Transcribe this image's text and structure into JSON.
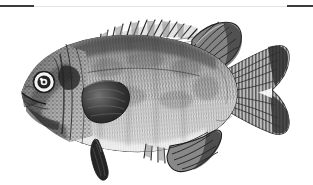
{
  "document": {
    "background_color": "#ffffff",
    "width_px": 313,
    "height_px": 185
  },
  "rule": {
    "name": "horizontal-rule",
    "hairline_color": "#e3e3e3",
    "segment_color": "#3a3a3a",
    "left_segment_label": "left rule segment",
    "right_segment_label": "right rule segment"
  },
  "illustration": {
    "type": "engraving",
    "subject": "sunfish",
    "orientation": "left-facing lateral view",
    "ink_color": "#2b2b2b",
    "midtone_color": "#8d8d8d",
    "highlight_color": "#f2f2f2",
    "parts": [
      {
        "id": "body",
        "label": "body"
      },
      {
        "id": "head",
        "label": "head"
      },
      {
        "id": "eye",
        "label": "eye"
      },
      {
        "id": "mouth",
        "label": "mouth"
      },
      {
        "id": "opercle",
        "label": "gill cover"
      },
      {
        "id": "spiny-dorsal-fin",
        "label": "spiny dorsal fin"
      },
      {
        "id": "soft-dorsal-fin",
        "label": "soft dorsal fin"
      },
      {
        "id": "pectoral-fin",
        "label": "pectoral fin"
      },
      {
        "id": "pelvic-fin",
        "label": "pelvic fin"
      },
      {
        "id": "anal-fin",
        "label": "anal fin"
      },
      {
        "id": "caudal-fin",
        "label": "caudal fin"
      },
      {
        "id": "scales",
        "label": "scale rows"
      }
    ]
  },
  "caption": {
    "text": ""
  }
}
